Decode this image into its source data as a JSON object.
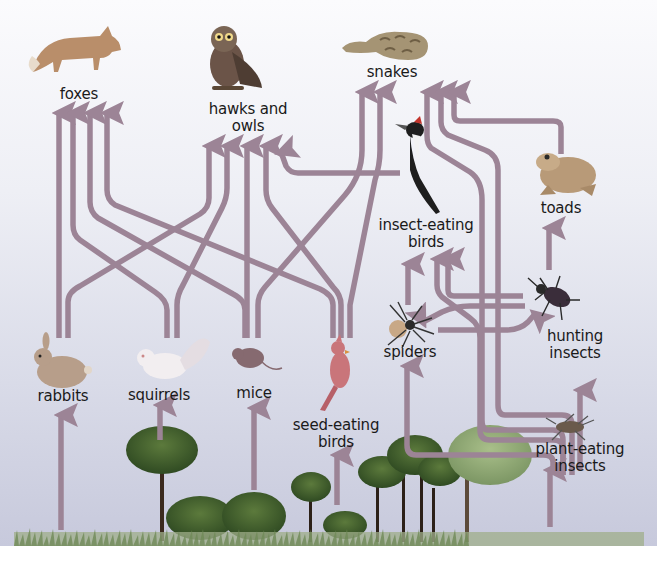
{
  "colors": {
    "arrow": "#9c8496",
    "background_top": "#fbfbfd",
    "background_bottom": "#c7c9dc",
    "tree_dark": "#3f5a2c",
    "tree_light": "#7f9a63",
    "grass": "#8aa072",
    "label": "#1a1a1a"
  },
  "organisms": [
    {
      "id": "foxes",
      "label": "foxes",
      "level": "top-consumer",
      "icon": "fox-icon"
    },
    {
      "id": "hawks_owls",
      "label": "hawks and owls",
      "line1": "hawks and",
      "line2": "owls",
      "level": "top-consumer",
      "icon": "owl-icon"
    },
    {
      "id": "snakes",
      "label": "snakes",
      "level": "top-consumer",
      "icon": "snake-icon"
    },
    {
      "id": "toads",
      "label": "toads",
      "level": "consumer",
      "icon": "toad-icon"
    },
    {
      "id": "insect_eating_birds",
      "label": "insect-eating birds",
      "line1": "insect-eating",
      "line2": "birds",
      "level": "consumer",
      "icon": "woodpecker-icon"
    },
    {
      "id": "spiders",
      "label": "spiders",
      "level": "consumer",
      "icon": "spider-icon"
    },
    {
      "id": "hunting_insects",
      "label": "hunting insects",
      "line1": "hunting",
      "line2": "insects",
      "level": "consumer",
      "icon": "beetle-icon"
    },
    {
      "id": "rabbits",
      "label": "rabbits",
      "level": "herbivore",
      "icon": "rabbit-icon"
    },
    {
      "id": "squirrels",
      "label": "squirrels",
      "level": "herbivore",
      "icon": "squirrel-icon"
    },
    {
      "id": "mice",
      "label": "mice",
      "level": "herbivore",
      "icon": "mouse-icon"
    },
    {
      "id": "seed_eating_birds",
      "label": "seed-eating birds",
      "line1": "seed-eating",
      "line2": "birds",
      "level": "herbivore",
      "icon": "cardinal-icon"
    },
    {
      "id": "plant_eating_insects",
      "label": "plant-eating insects",
      "line1": "plant-eating",
      "line2": "insects",
      "level": "herbivore",
      "icon": "cricket-icon"
    },
    {
      "id": "plants",
      "label": "",
      "level": "producer",
      "icon": "tree-icon"
    }
  ],
  "links": [
    {
      "from": "rabbits",
      "to": "foxes"
    },
    {
      "from": "squirrels",
      "to": "foxes"
    },
    {
      "from": "mice",
      "to": "foxes"
    },
    {
      "from": "seed_eating_birds",
      "to": "foxes"
    },
    {
      "from": "rabbits",
      "to": "hawks_owls"
    },
    {
      "from": "squirrels",
      "to": "hawks_owls"
    },
    {
      "from": "mice",
      "to": "hawks_owls"
    },
    {
      "from": "seed_eating_birds",
      "to": "hawks_owls"
    },
    {
      "from": "insect_eating_birds",
      "to": "hawks_owls"
    },
    {
      "from": "mice",
      "to": "snakes"
    },
    {
      "from": "seed_eating_birds",
      "to": "snakes"
    },
    {
      "from": "plant_eating_insects",
      "to": "snakes"
    },
    {
      "from": "plant_eating_insects",
      "to": "snakes"
    },
    {
      "from": "toads",
      "to": "snakes"
    },
    {
      "from": "hunting_insects",
      "to": "toads"
    },
    {
      "from": "spiders",
      "to": "insect_eating_birds"
    },
    {
      "from": "hunting_insects",
      "to": "insect_eating_birds"
    },
    {
      "from": "plant_eating_insects",
      "to": "insect_eating_birds"
    },
    {
      "from": "hunting_insects",
      "to": "spiders"
    },
    {
      "from": "spiders",
      "to": "hunting_insects"
    },
    {
      "from": "plant_eating_insects",
      "to": "spiders"
    },
    {
      "from": "plant_eating_insects",
      "to": "hunting_insects"
    },
    {
      "from": "plants",
      "to": "rabbits"
    },
    {
      "from": "plants",
      "to": "squirrels"
    },
    {
      "from": "plants",
      "to": "mice"
    },
    {
      "from": "plants",
      "to": "seed_eating_birds"
    },
    {
      "from": "plants",
      "to": "plant_eating_insects"
    }
  ]
}
